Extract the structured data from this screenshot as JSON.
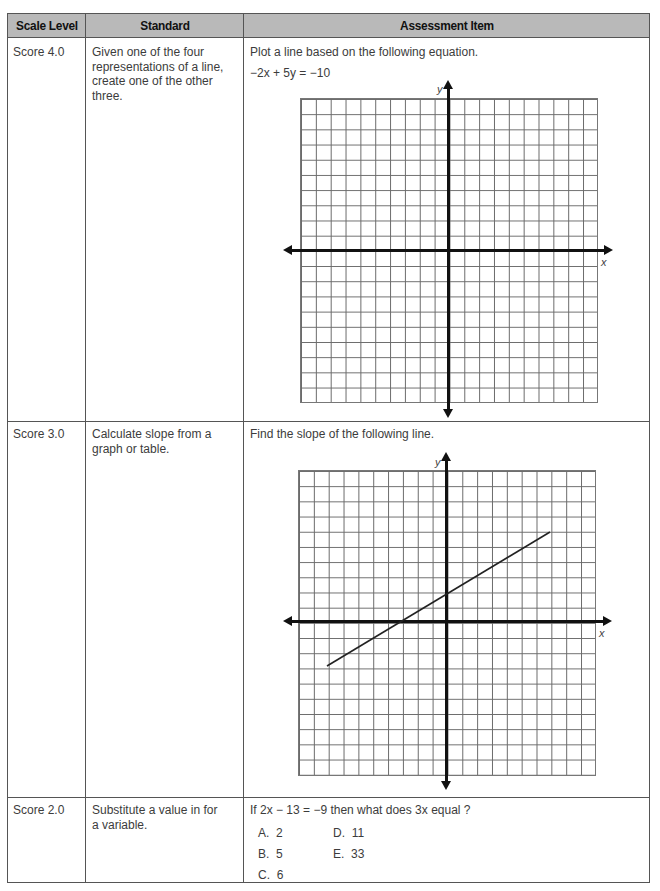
{
  "table": {
    "headers": [
      "Scale Level",
      "Standard",
      "Assessment Item"
    ],
    "rows": [
      {
        "scale_level": "Score 4.0",
        "standard": "Given one of the four representations of a line, create one of the other three.",
        "item_prompt": "Plot a line based on the following equation.",
        "item_equation": "−2x + 5y = −10",
        "graph": {
          "x_label": "x",
          "y_label": "y",
          "grid": "20x20",
          "line": null
        }
      },
      {
        "scale_level": "Score 3.0",
        "standard": "Calculate slope from a graph or table.",
        "item_prompt": "Find the slope of the following line.",
        "graph": {
          "x_label": "x",
          "y_label": "y",
          "grid": "20x20",
          "line": {
            "from": [
              -8,
              -3.33
            ],
            "to": [
              7,
              6.67
            ],
            "passes_through": [
              [
                -3,
                0
              ],
              [
                0,
                2
              ]
            ]
          }
        }
      },
      {
        "scale_level": "Score 2.0",
        "standard": "Substitute a value in for a variable.",
        "item_prompt": "If 2x − 13 = −9 then what does 3x equal ?",
        "choices": [
          {
            "letter": "A.",
            "value": "2"
          },
          {
            "letter": "B.",
            "value": "5"
          },
          {
            "letter": "C.",
            "value": "6"
          },
          {
            "letter": "D.",
            "value": "11"
          },
          {
            "letter": "E.",
            "value": "33"
          }
        ]
      }
    ]
  },
  "colors": {
    "header_bg": "#b9b9b9",
    "border": "#555555",
    "axis": "#111111",
    "grid": "#6a6a6a"
  }
}
